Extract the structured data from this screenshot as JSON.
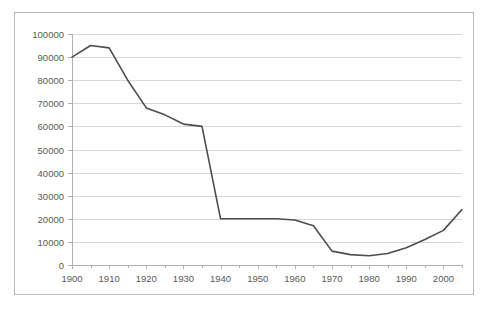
{
  "chart_data": {
    "type": "line",
    "title": "",
    "subtitle": "",
    "xlabel": "",
    "ylabel": "",
    "xlim": [
      1900,
      2005
    ],
    "ylim": [
      0,
      100000
    ],
    "grid": true,
    "legend": false,
    "legend_position": "none",
    "line_color": "#4d4d4d",
    "grid_color": "#d8d8d8",
    "axis_color": "#b0b0b0",
    "frame_color": "#b9b9b9",
    "background_color": "#ffffff",
    "y_ticks": [
      0,
      10000,
      20000,
      30000,
      40000,
      50000,
      60000,
      70000,
      80000,
      90000,
      100000
    ],
    "y_tick_labels": [
      "0",
      "10000",
      "20000",
      "30000",
      "40000",
      "50000",
      "60000",
      "70000",
      "80000",
      "90000",
      "100000"
    ],
    "x_ticks": [
      1900,
      1910,
      1920,
      1930,
      1940,
      1950,
      1960,
      1970,
      1980,
      1990,
      2000
    ],
    "x_tick_labels": [
      "1900",
      "1910",
      "1920",
      "1930",
      "1940",
      "1950",
      "1960",
      "1970",
      "1980",
      "1990",
      "2000"
    ],
    "x_minor_tick_interval": 5,
    "series": [
      {
        "name": "series-1",
        "x": [
          1900,
          1905,
          1910,
          1915,
          1920,
          1925,
          1930,
          1935,
          1940,
          1945,
          1950,
          1955,
          1960,
          1965,
          1970,
          1975,
          1980,
          1985,
          1990,
          1995,
          2000,
          2005
        ],
        "values": [
          90000,
          95000,
          94000,
          80000,
          68000,
          65000,
          61000,
          60000,
          20000,
          20000,
          20000,
          20000,
          19500,
          17000,
          6000,
          4500,
          4000,
          5000,
          7500,
          11000,
          15000,
          24000
        ]
      }
    ]
  }
}
